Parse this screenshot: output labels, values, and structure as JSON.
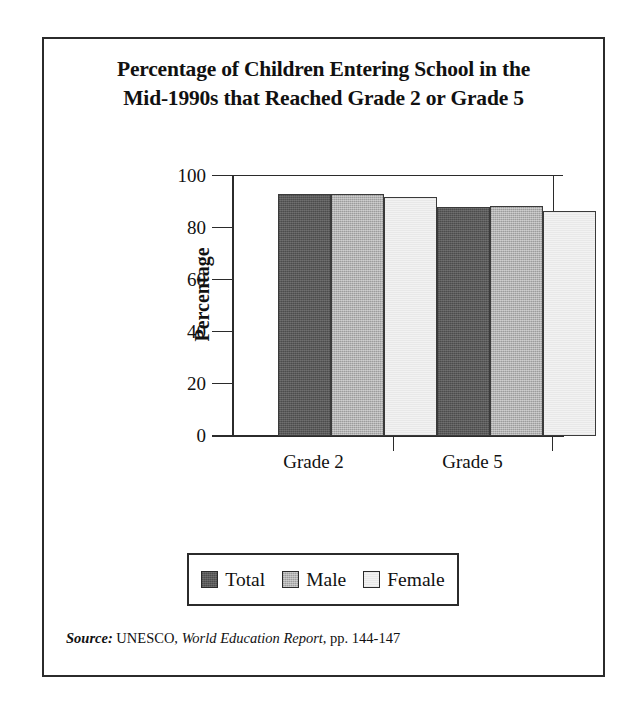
{
  "figure": {
    "title_line_1": "Percentage of Children Entering School in the",
    "title_line_2": "Mid-1990s that Reached Grade 2 or Grade 5"
  },
  "source": {
    "label": "Source:",
    "organization": "UNESCO,",
    "publication": "World Education Report",
    "pages": ", pp. 144-147"
  },
  "legend": {
    "items": [
      {
        "label": "Total",
        "color": "#5a5a5a",
        "swatch": "legend-swatch-total"
      },
      {
        "label": "Male",
        "color": "#b3b3b3",
        "swatch": "legend-swatch-male"
      },
      {
        "label": "Female",
        "color": "#f2f2f2",
        "swatch": "legend-swatch-female"
      }
    ]
  },
  "chart_data": {
    "type": "bar",
    "title": "Percentage of Children Entering School in the Mid-1990s that Reached Grade 2 or Grade 5",
    "xlabel": "",
    "ylabel": "Percentage",
    "categories": [
      "Grade 2",
      "Grade 5"
    ],
    "series": [
      {
        "name": "Total",
        "values": [
          93,
          88
        ],
        "color": "#5a5a5a"
      },
      {
        "name": "Male",
        "values": [
          93,
          88.5
        ],
        "color": "#b3b3b3"
      },
      {
        "name": "Female",
        "values": [
          92,
          86.5
        ],
        "color": "#f2f2f2"
      }
    ],
    "ylim": [
      0,
      100
    ],
    "yticks": [
      0,
      20,
      40,
      60,
      80,
      100
    ],
    "ytick_labels": [
      "0",
      "20",
      "40",
      "60",
      "80",
      "100"
    ],
    "grid": false,
    "legend_position": "bottom-outside"
  }
}
